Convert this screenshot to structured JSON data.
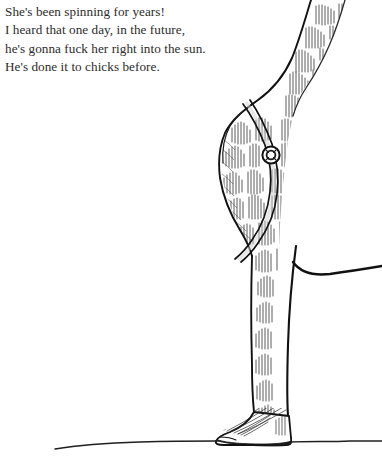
{
  "page": {
    "background_color": "#ffffff",
    "width": 382,
    "height": 475
  },
  "caption": {
    "text_color": "#2b2b2b",
    "lines": [
      "She's been spinning for years!",
      "I heard that one day, in the future,",
      "he's gonna fuck her right into the sun.",
      "He's done it to chicks before."
    ]
  },
  "illustration": {
    "subject": "giraffe",
    "style": "pen-and-ink cross-hatch line drawing",
    "ink_color": "#1a1a1a",
    "parts": [
      {
        "name": "neck",
        "description": "long neck curving up and exiting the top-right edge"
      },
      {
        "name": "shoulder",
        "description": "bulge at upper-left of the body mass"
      },
      {
        "name": "halter-strap",
        "description": "double-line strap running diagonally across the neck"
      },
      {
        "name": "strap-ring",
        "description": "small circular buckle ring on the strap"
      },
      {
        "name": "body-contour",
        "description": "bold curve sweeping right from the leg, exiting the right edge"
      },
      {
        "name": "foreleg",
        "description": "near-vertical leg descending to the ground"
      },
      {
        "name": "hoof",
        "description": "hoof splayed to the left with radiating hatch lines"
      },
      {
        "name": "ground-line",
        "description": "slightly wavy horizontal ground line"
      },
      {
        "name": "coat-spots",
        "description": "giraffe patches drawn as hatched blocks"
      }
    ]
  }
}
